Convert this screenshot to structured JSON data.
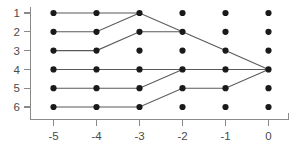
{
  "chart_data": {
    "type": "scatter",
    "title": "",
    "xlabel": "",
    "ylabel": "",
    "grid": false,
    "legend": null,
    "x_ticks": [
      "-5",
      "-4",
      "-3",
      "-2",
      "-1",
      "0"
    ],
    "x_tick_values": [
      -5,
      -4,
      -3,
      -2,
      -1,
      0
    ],
    "y_ticks": [
      "1",
      "2",
      "3",
      "4",
      "5",
      "6"
    ],
    "y_tick_values": [
      1,
      2,
      3,
      4,
      5,
      6
    ],
    "xlim": [
      -5.6,
      0.6
    ],
    "ylim": [
      6.6,
      0.4
    ],
    "y_axis_inverted": true,
    "points": [
      {
        "x": -5,
        "y": 1
      },
      {
        "x": -4,
        "y": 1
      },
      {
        "x": -3,
        "y": 1
      },
      {
        "x": -2,
        "y": 1
      },
      {
        "x": -1,
        "y": 1
      },
      {
        "x": 0,
        "y": 1
      },
      {
        "x": -5,
        "y": 2
      },
      {
        "x": -4,
        "y": 2
      },
      {
        "x": -3,
        "y": 2
      },
      {
        "x": -2,
        "y": 2
      },
      {
        "x": -1,
        "y": 2
      },
      {
        "x": 0,
        "y": 2
      },
      {
        "x": -5,
        "y": 3
      },
      {
        "x": -4,
        "y": 3
      },
      {
        "x": -3,
        "y": 3
      },
      {
        "x": -2,
        "y": 3
      },
      {
        "x": -1,
        "y": 3
      },
      {
        "x": 0,
        "y": 3
      },
      {
        "x": -5,
        "y": 4
      },
      {
        "x": -4,
        "y": 4
      },
      {
        "x": -3,
        "y": 4
      },
      {
        "x": -2,
        "y": 4
      },
      {
        "x": -1,
        "y": 4
      },
      {
        "x": 0,
        "y": 4
      },
      {
        "x": -5,
        "y": 5
      },
      {
        "x": -4,
        "y": 5
      },
      {
        "x": -3,
        "y": 5
      },
      {
        "x": -2,
        "y": 5
      },
      {
        "x": -1,
        "y": 5
      },
      {
        "x": 0,
        "y": 5
      },
      {
        "x": -5,
        "y": 6
      },
      {
        "x": -4,
        "y": 6
      },
      {
        "x": -3,
        "y": 6
      },
      {
        "x": -2,
        "y": 6
      },
      {
        "x": -1,
        "y": 6
      },
      {
        "x": 0,
        "y": 6
      }
    ],
    "paths": [
      {
        "name": "path-row-1",
        "points": [
          [
            -5,
            1
          ],
          [
            -4,
            1
          ],
          [
            -3,
            1
          ],
          [
            -2,
            2
          ],
          [
            -1,
            3
          ],
          [
            0,
            4
          ]
        ]
      },
      {
        "name": "path-row-2",
        "points": [
          [
            -5,
            2
          ],
          [
            -4,
            2
          ],
          [
            -3,
            1
          ]
        ]
      },
      {
        "name": "path-row-3",
        "points": [
          [
            -5,
            3
          ],
          [
            -4,
            3
          ],
          [
            -3,
            2
          ],
          [
            -2,
            2
          ]
        ]
      },
      {
        "name": "path-row-4",
        "points": [
          [
            -5,
            4
          ],
          [
            -4,
            4
          ],
          [
            -3,
            4
          ],
          [
            -2,
            4
          ],
          [
            -1,
            4
          ],
          [
            0,
            4
          ]
        ]
      },
      {
        "name": "path-row-5",
        "points": [
          [
            -5,
            5
          ],
          [
            -4,
            5
          ],
          [
            -3,
            5
          ],
          [
            -2,
            4
          ]
        ]
      },
      {
        "name": "path-row-6",
        "points": [
          [
            -5,
            6
          ],
          [
            -4,
            6
          ],
          [
            -3,
            6
          ],
          [
            -2,
            5
          ],
          [
            -1,
            5
          ],
          [
            0,
            4
          ]
        ]
      }
    ],
    "colors": {
      "dot": "#1a1a1a",
      "edge": "#595959",
      "axis": "#8a8a8a",
      "tick_label": "#4a4a4a",
      "background": "#ffffff"
    }
  }
}
